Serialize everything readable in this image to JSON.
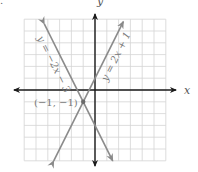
{
  "chart_data": {
    "type": "line",
    "title": "",
    "xlabel": "x",
    "ylabel": "y",
    "xlim": [
      -6,
      6
    ],
    "ylim": [
      -6,
      6
    ],
    "grid": true,
    "grid_step": 1,
    "series": [
      {
        "name": "y = 2x + 1",
        "slope": 2,
        "intercept": 1,
        "x": [
          -3.5,
          2.4
        ],
        "y": [
          -6,
          5.8
        ],
        "label": "y = 2x + 1"
      },
      {
        "name": "y = −2x − 3",
        "slope": -2,
        "intercept": -3,
        "x": [
          -4.3,
          1.5
        ],
        "y": [
          5.6,
          -6
        ],
        "label": "y = −2x − 3"
      }
    ],
    "annotations": [
      {
        "text": "(−1, −1)",
        "x": -1,
        "y": -1,
        "type": "intersection-point"
      }
    ]
  },
  "labels": {
    "x_axis": "x",
    "y_axis": "y",
    "line1": "y = 2x + 1",
    "line2": "y = −2x − 3",
    "point": "(−1, −1)",
    "corner": "."
  },
  "colors": {
    "grid": "#d4d4d4",
    "axis": "#1a1a1a",
    "line": "#8a8a8a",
    "text": "#7a7a7a"
  }
}
